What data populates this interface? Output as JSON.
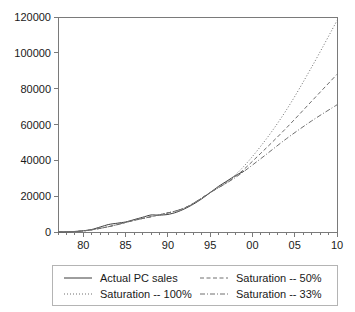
{
  "chart_data": {
    "type": "line",
    "title": "",
    "subtitle": "",
    "xlabel": "",
    "ylabel": "",
    "xlim": [
      1977,
      2010
    ],
    "ylim": [
      0,
      120000
    ],
    "grid": false,
    "legend_position": "bottom",
    "x_tick_labels": [
      "80",
      "85",
      "90",
      "95",
      "00",
      "05",
      "10"
    ],
    "x_tick_values": [
      1980,
      1985,
      1990,
      1995,
      2000,
      2005,
      2010
    ],
    "x_minor_tick_step": 1,
    "y_tick_labels": [
      "0",
      "20000",
      "40000",
      "60000",
      "80000",
      "100000",
      "120000"
    ],
    "y_tick_values": [
      0,
      20000,
      40000,
      60000,
      80000,
      100000,
      120000
    ],
    "series": [
      {
        "name": "Actual PC sales",
        "style": "solid",
        "color": "#3c3c3c",
        "x": [
          1977,
          1978,
          1979,
          1980,
          1981,
          1982,
          1983,
          1984,
          1985,
          1986,
          1987,
          1988,
          1989,
          1990,
          1991,
          1992,
          1993,
          1994,
          1995,
          1996,
          1997,
          1998,
          1999
        ],
        "values": [
          50,
          120,
          300,
          700,
          1400,
          2800,
          4200,
          4900,
          5600,
          6900,
          8200,
          9500,
          9400,
          9800,
          11000,
          13000,
          15500,
          18500,
          22000,
          25500,
          28500,
          31500,
          34000
        ]
      },
      {
        "name": "Saturation -- 100%",
        "style": "dotted",
        "color": "#6e6e6e",
        "x": [
          1977,
          1980,
          1983,
          1986,
          1989,
          1992,
          1995,
          1998,
          2001,
          2004,
          2007,
          2010
        ],
        "values": [
          60,
          600,
          3000,
          6500,
          9600,
          13500,
          22000,
          32000,
          48000,
          68000,
          92000,
          118000
        ]
      },
      {
        "name": "Saturation -- 50%",
        "style": "dashed",
        "color": "#6e6e6e",
        "x": [
          1977,
          1980,
          1983,
          1986,
          1989,
          1992,
          1995,
          1998,
          2001,
          2004,
          2007,
          2010
        ],
        "values": [
          60,
          600,
          3000,
          6500,
          9600,
          13500,
          22000,
          31000,
          44000,
          58000,
          73000,
          88000
        ]
      },
      {
        "name": "Saturation -- 33%",
        "style": "dashdot",
        "color": "#6e6e6e",
        "x": [
          1977,
          1980,
          1983,
          1986,
          1989,
          1992,
          1995,
          1998,
          2001,
          2004,
          2007,
          2010
        ],
        "values": [
          60,
          600,
          3000,
          6500,
          9600,
          13500,
          22000,
          30500,
          41000,
          52000,
          62000,
          71000
        ]
      }
    ]
  },
  "legend": {
    "entries": [
      {
        "label": "Actual PC sales",
        "style": "solid"
      },
      {
        "label": "Saturation -- 50%",
        "style": "dashed"
      },
      {
        "label": "Saturation -- 100%",
        "style": "dotted"
      },
      {
        "label": "Saturation -- 33%",
        "style": "dashdot"
      }
    ]
  },
  "colors": {
    "background": "#ffffff",
    "axis": "#7a7a7a",
    "text": "#1a1a1a",
    "legend_border": "#b4b4b4",
    "actual_series": "#3c3c3c",
    "projection_series": "#6e6e6e"
  }
}
